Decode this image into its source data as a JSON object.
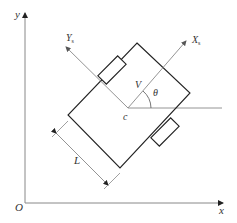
{
  "diagram": {
    "type": "differential-drive-robot-kinematics",
    "colors": {
      "body_stroke": "#222222",
      "axis_stroke": "#888888",
      "label": "#333333",
      "background": "#ffffff"
    },
    "labels": {
      "y_axis": "y",
      "x_axis": "x",
      "origin": "O",
      "robot_y_axis": "Y",
      "robot_y_axis_sub": "s",
      "robot_x_axis": "X",
      "robot_x_axis_sub": "s",
      "velocity": "V",
      "angle": "θ",
      "center": "c",
      "wheel_base": "L"
    },
    "elements": [
      "world-x-axis",
      "world-y-axis",
      "robot-body",
      "left-wheel",
      "right-wheel",
      "robot-x-axis",
      "robot-y-axis",
      "heading-reference-line",
      "angle-arc",
      "wheel-base-dimension"
    ]
  }
}
